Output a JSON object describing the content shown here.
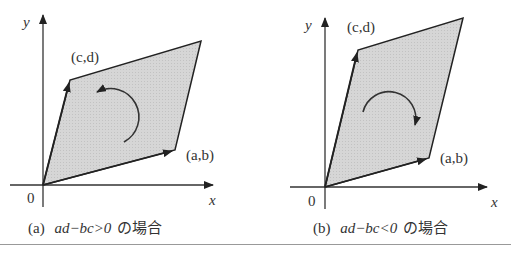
{
  "panels": [
    {
      "id": "a",
      "caption_prefix": "(a)",
      "caption_expr": "ad−bc>0",
      "caption_suffix": "の場合",
      "axis_x": "x",
      "axis_y": "y",
      "origin": "0",
      "vertex_ab": "(a,b)",
      "vertex_cd": "(c,d)",
      "rotation": "counterclockwise"
    },
    {
      "id": "b",
      "caption_prefix": "(b)",
      "caption_expr": "ad−bc<0",
      "caption_suffix": "の場合",
      "axis_x": "x",
      "axis_y": "y",
      "origin": "0",
      "vertex_ab": "(a,b)",
      "vertex_cd": "(c,d)",
      "rotation": "clockwise"
    }
  ],
  "colors": {
    "fill": "#d4d4d4",
    "stroke": "#222222",
    "rule": "#999999"
  }
}
